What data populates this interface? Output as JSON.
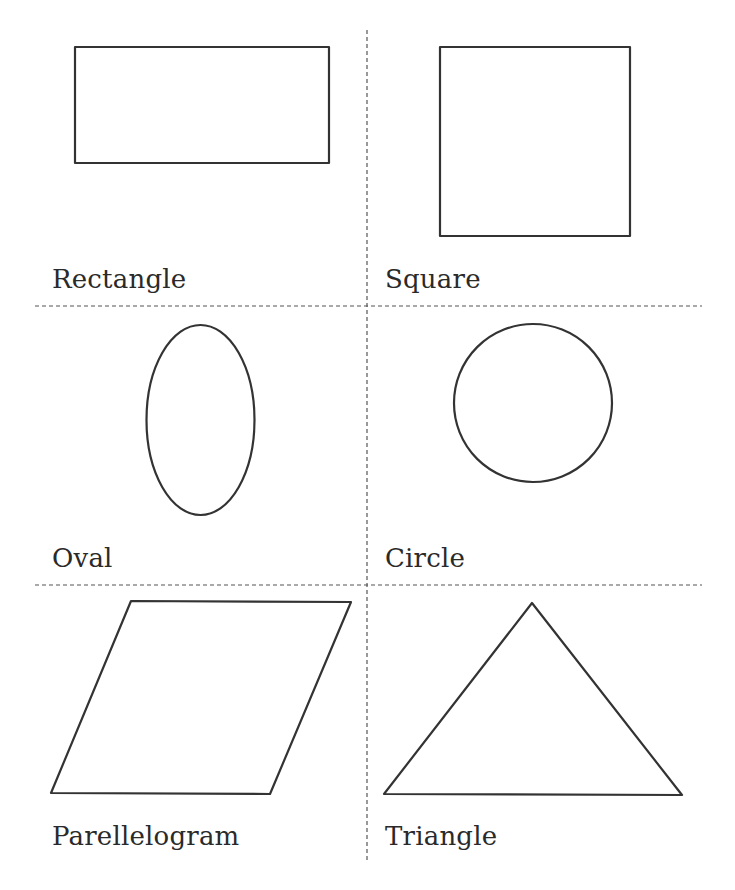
{
  "worksheet": {
    "title_clipped": "",
    "colors": {
      "stroke": "#333333",
      "divider": "#555555",
      "text": "#2a2a2a",
      "background": "#ffffff"
    },
    "cells": [
      {
        "id": "rectangle",
        "label": "Rectangle"
      },
      {
        "id": "square",
        "label": "Square"
      },
      {
        "id": "oval",
        "label": "Oval"
      },
      {
        "id": "circle",
        "label": "Circle"
      },
      {
        "id": "parallelogram",
        "label": "Parellelogram"
      },
      {
        "id": "triangle",
        "label": "Triangle"
      }
    ]
  }
}
